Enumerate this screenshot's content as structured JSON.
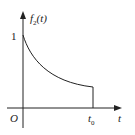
{
  "diagram": {
    "y_axis_label": "f",
    "y_axis_label_sub": "2",
    "y_axis_label_arg": "(t)",
    "x_axis_label": "t",
    "origin_label": "O",
    "y_tick_label": "1",
    "x_tick_label": "t",
    "x_tick_label_sub": "0"
  },
  "colors": {
    "line": "#222222",
    "background": "#ffffff"
  }
}
